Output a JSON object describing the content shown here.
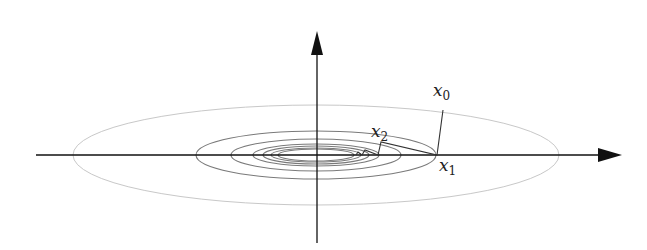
{
  "diagram": {
    "colors": {
      "axis": "#111111",
      "outer_contour": "#c8c8c8",
      "contour": "#7a7a7a",
      "path": "#333333",
      "background": "#ffffff"
    },
    "center": [
      316,
      155
    ],
    "axes": {
      "x_axis": {
        "from": [
          36,
          155
        ],
        "to": [
          622,
          155
        ]
      },
      "y_axis": {
        "from": [
          317,
          243
        ],
        "to": [
          317,
          31
        ]
      }
    },
    "contours": [
      {
        "rx": 243,
        "ry": 50,
        "style": "outer"
      },
      {
        "rx": 120,
        "ry": 24,
        "style": "inner"
      },
      {
        "rx": 85,
        "ry": 16,
        "style": "inner"
      },
      {
        "rx": 63,
        "ry": 11,
        "style": "inner"
      },
      {
        "rx": 53,
        "ry": 9,
        "style": "inner"
      },
      {
        "rx": 45,
        "ry": 7,
        "style": "inner"
      },
      {
        "rx": 38,
        "ry": 6,
        "style": "inner"
      }
    ],
    "path_points": [
      [
        443,
        110
      ],
      [
        437,
        155
      ],
      [
        381,
        142
      ],
      [
        378,
        155
      ],
      [
        365,
        150
      ],
      [
        362,
        155
      ],
      [
        358,
        152
      ],
      [
        356,
        155
      ]
    ],
    "labels": [
      {
        "name": "x0",
        "base": "x",
        "sub": "0",
        "x": 433,
        "y": 96
      },
      {
        "name": "x2",
        "base": "x",
        "sub": "2",
        "x": 371,
        "y": 137
      },
      {
        "name": "x1",
        "base": "x",
        "sub": "1",
        "x": 439,
        "y": 172
      }
    ]
  },
  "labels": {
    "x0_base": "x",
    "x0_sub": "0",
    "x1_base": "x",
    "x1_sub": "1",
    "x2_base": "x",
    "x2_sub": "2"
  }
}
